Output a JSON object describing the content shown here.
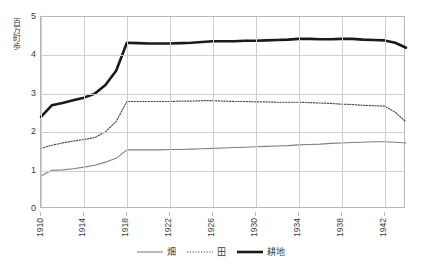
{
  "chart_data": {
    "type": "line",
    "title": "",
    "xlabel": "",
    "ylabel": "百万町歩",
    "ylim": [
      0,
      5
    ],
    "xlim": [
      1910,
      1944
    ],
    "grid": true,
    "legend_position": "bottom",
    "y_ticks": [
      "5",
      "4",
      "3",
      "2",
      "1",
      "0"
    ],
    "y_tick_values": [
      5,
      4,
      3,
      2,
      1,
      0
    ],
    "x_ticks": [
      "1910",
      "1914",
      "1918",
      "1922",
      "1926",
      "1930",
      "1934",
      "1938",
      "1942"
    ],
    "x_tick_values": [
      1910,
      1914,
      1918,
      1922,
      1926,
      1930,
      1934,
      1938,
      1942
    ],
    "x": [
      1910,
      1911,
      1912,
      1913,
      1914,
      1915,
      1916,
      1917,
      1918,
      1919,
      1920,
      1921,
      1922,
      1923,
      1924,
      1925,
      1926,
      1927,
      1928,
      1929,
      1930,
      1931,
      1932,
      1933,
      1934,
      1935,
      1936,
      1937,
      1938,
      1939,
      1940,
      1941,
      1942,
      1943,
      1944
    ],
    "series": [
      {
        "name": "畑",
        "style": "solid-thin",
        "color": "#808080",
        "values": [
          0.86,
          1.01,
          1.02,
          1.05,
          1.09,
          1.14,
          1.22,
          1.32,
          1.54,
          1.54,
          1.54,
          1.54,
          1.55,
          1.55,
          1.56,
          1.57,
          1.58,
          1.59,
          1.6,
          1.61,
          1.62,
          1.63,
          1.64,
          1.65,
          1.67,
          1.68,
          1.69,
          1.71,
          1.72,
          1.73,
          1.74,
          1.75,
          1.75,
          1.74,
          1.72
        ]
      },
      {
        "name": "田",
        "style": "dotted",
        "color": "#4d4d4d",
        "values": [
          1.58,
          1.66,
          1.72,
          1.77,
          1.81,
          1.86,
          2.01,
          2.28,
          2.8,
          2.8,
          2.8,
          2.8,
          2.8,
          2.81,
          2.81,
          2.82,
          2.82,
          2.81,
          2.8,
          2.8,
          2.79,
          2.79,
          2.78,
          2.78,
          2.78,
          2.77,
          2.76,
          2.75,
          2.73,
          2.72,
          2.7,
          2.69,
          2.68,
          2.52,
          2.27
        ]
      },
      {
        "name": "耕地",
        "style": "solid-thick",
        "color": "#1a1a1a",
        "values": [
          2.4,
          2.7,
          2.76,
          2.83,
          2.9,
          3.0,
          3.23,
          3.6,
          4.33,
          4.32,
          4.31,
          4.31,
          4.31,
          4.32,
          4.33,
          4.35,
          4.37,
          4.37,
          4.37,
          4.38,
          4.38,
          4.39,
          4.4,
          4.41,
          4.43,
          4.43,
          4.42,
          4.42,
          4.43,
          4.43,
          4.41,
          4.4,
          4.39,
          4.33,
          4.2
        ]
      }
    ]
  },
  "legend": {
    "items": [
      {
        "label": "畑",
        "style": "solid-thin"
      },
      {
        "label": "田",
        "style": "dotted"
      },
      {
        "label": "耕地",
        "style": "solid-thick"
      }
    ]
  }
}
